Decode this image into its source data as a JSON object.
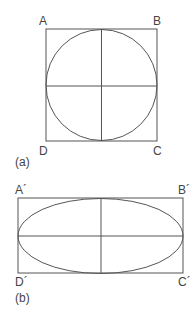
{
  "figure_a": {
    "caption": "(a)",
    "labels": {
      "top_left": "A",
      "top_right": "B",
      "bottom_right": "C",
      "bottom_left": "D"
    },
    "shape": "circle inscribed in square with horizontal and vertical diameters"
  },
  "figure_b": {
    "caption": "(b)",
    "labels": {
      "top_left": "A´",
      "top_right": "B´",
      "bottom_right": "C´",
      "bottom_left": "D´"
    },
    "shape": "ellipse inscribed in rectangle with major and minor axes"
  },
  "colors": {
    "stroke": "#555555",
    "background": "#ffffff"
  }
}
